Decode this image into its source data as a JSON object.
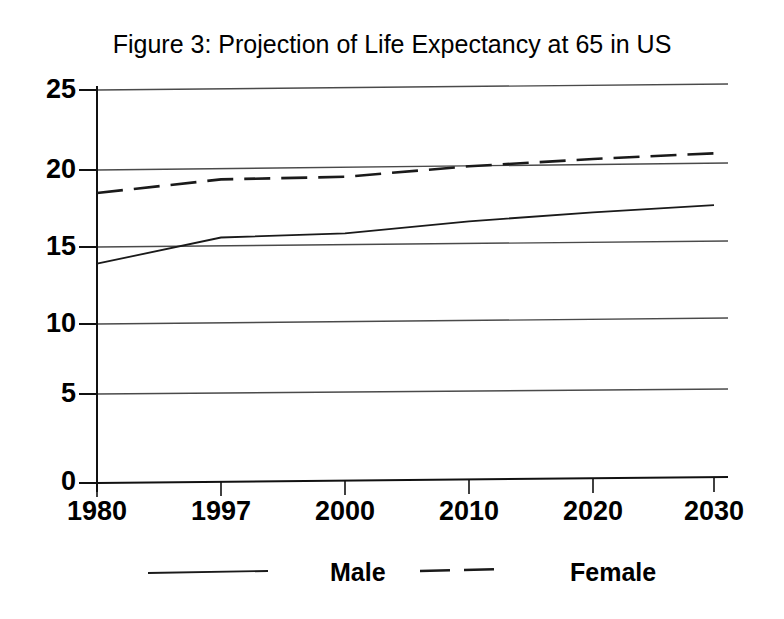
{
  "figure": {
    "title": "Figure 3:  Projection of Life Expectancy at 65 in US"
  },
  "legend": {
    "male_label": "Male",
    "female_label": "Female",
    "position": "bottom"
  },
  "axes": {
    "y_ticks": [
      "25",
      "20",
      "15",
      "10",
      "5",
      "0"
    ],
    "x_ticks": [
      "1980",
      "1997",
      "2000",
      "2010",
      "2020",
      "2030"
    ]
  },
  "colors": {
    "line": "#1a1a1a",
    "grid": "#555555",
    "background": "#ffffff"
  },
  "chart_data": {
    "type": "line",
    "title": "Figure 3:  Projection of Life Expectancy at 65 in US",
    "xlabel": "",
    "ylabel": "",
    "categories": [
      "1980",
      "1997",
      "2000",
      "2010",
      "2020",
      "2030"
    ],
    "ylim": [
      0,
      25
    ],
    "yticks": [
      0,
      5,
      10,
      15,
      20,
      25
    ],
    "grid": true,
    "legend_position": "bottom",
    "series": [
      {
        "name": "Male",
        "style": "solid",
        "values": [
          13.9,
          15.5,
          15.7,
          16.4,
          16.9,
          17.3
        ]
      },
      {
        "name": "Female",
        "style": "dashed",
        "values": [
          18.4,
          19.2,
          19.3,
          19.9,
          20.3,
          20.6
        ]
      }
    ]
  }
}
